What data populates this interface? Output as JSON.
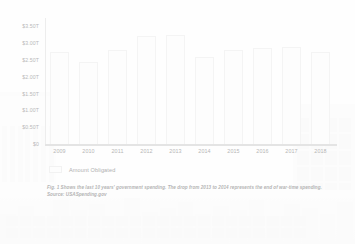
{
  "chart_data": {
    "type": "bar",
    "title": "",
    "xlabel": "",
    "ylabel": "",
    "categories": [
      "2009",
      "2010",
      "2011",
      "2012",
      "2013",
      "2014",
      "2015",
      "2016",
      "2017",
      "2018"
    ],
    "series": [
      {
        "name": "Amount Obligated",
        "values": [
          2.75,
          2.45,
          2.8,
          3.2,
          3.25,
          2.6,
          2.8,
          2.85,
          2.9,
          2.75
        ]
      }
    ],
    "value_unit": "trillions of USD",
    "ylim": [
      0,
      3.75
    ],
    "y_tick_values": [
      0,
      0.5,
      1.0,
      1.5,
      2.0,
      2.5,
      3.0,
      3.5
    ],
    "y_tick_labels": [
      "$0",
      "$0.50T",
      "$1.00T",
      "$1.50T",
      "$2.00T",
      "$2.50T",
      "$3.00T",
      "$3.50T"
    ],
    "grid": false,
    "legend_position": "bottom-left",
    "bar_color": "#fdfdfd",
    "axis_color": "#e4e4e4",
    "tick_label_color": "#b9b9b9"
  },
  "legend": {
    "swatch_name": "amount-obligated-swatch",
    "label": "Amount Obligated"
  },
  "caption": {
    "text": "Fig. 1 Shows the last 10 years' government spending. The drop from 2013 to 2014 represents the end of war-time spending.",
    "source": "Source: USASpending.gov"
  },
  "background": {
    "description": "faint government building facade watermark"
  }
}
